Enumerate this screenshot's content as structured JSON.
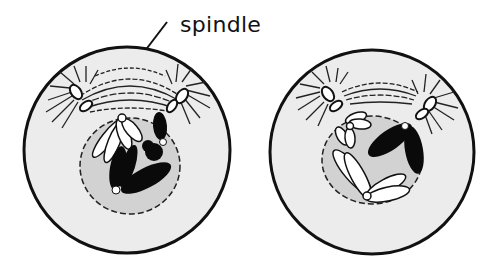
{
  "diagram": {
    "label": "spindle",
    "cells": [
      {
        "id": "left-cell",
        "stage": "spindle forming between separating centriole pairs; chromosomes inside nucleus"
      },
      {
        "id": "right-cell",
        "stage": "spindle forming; white and black chromosomes inside nucleus"
      }
    ],
    "colors": {
      "outline": "#111111",
      "cytoplasm": "#ececec",
      "nucleus": "#d4d4d4",
      "chromosome_dark": "#0a0a0a",
      "chromosome_light": "#ffffff",
      "background": "#ffffff"
    }
  }
}
